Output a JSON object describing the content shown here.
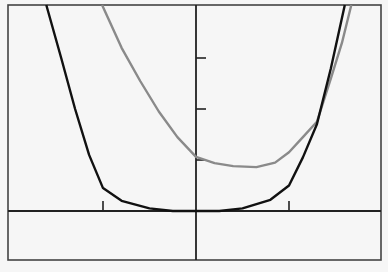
{
  "chart_data": {
    "type": "line",
    "title": "",
    "xlabel": "",
    "ylabel": "",
    "grid": false,
    "legend": null,
    "xlim": [
      -2.02,
      1.99
    ],
    "ylim": [
      -0.96,
      4.04
    ],
    "x_ticks": [
      -1,
      1
    ],
    "y_ticks": [
      1,
      2,
      3
    ],
    "tick_labels_shown": false,
    "series": [
      {
        "name": "black-curve",
        "color": "#111111",
        "points": [
          [
            -1.61,
            4.04
          ],
          [
            -1.45,
            3.0
          ],
          [
            -1.3,
            2.0
          ],
          [
            -1.15,
            1.1
          ],
          [
            -1.0,
            0.45
          ],
          [
            -0.8,
            0.2
          ],
          [
            -0.5,
            0.05
          ],
          [
            -0.25,
            0.0
          ],
          [
            0,
            0
          ],
          [
            0.25,
            0.0
          ],
          [
            0.5,
            0.05
          ],
          [
            0.8,
            0.22
          ],
          [
            1.0,
            0.5
          ],
          [
            1.15,
            1.05
          ],
          [
            1.3,
            1.7
          ],
          [
            1.45,
            2.8
          ],
          [
            1.6,
            4.04
          ]
        ]
      },
      {
        "name": "gray-curve",
        "color": "#8a8a8a",
        "points": [
          [
            -1.01,
            4.04
          ],
          [
            -0.8,
            3.2
          ],
          [
            -0.6,
            2.55
          ],
          [
            -0.4,
            1.95
          ],
          [
            -0.2,
            1.45
          ],
          [
            0,
            1.06
          ],
          [
            0.2,
            0.94
          ],
          [
            0.4,
            0.88
          ],
          [
            0.65,
            0.86
          ],
          [
            0.85,
            0.95
          ],
          [
            1.0,
            1.15
          ],
          [
            1.15,
            1.45
          ],
          [
            1.3,
            1.75
          ],
          [
            1.45,
            2.6
          ],
          [
            1.57,
            3.3
          ],
          [
            1.67,
            4.04
          ]
        ]
      }
    ]
  },
  "colors": {
    "background": "#f6f6f6",
    "frame": "#444444",
    "axis": "#222222"
  }
}
